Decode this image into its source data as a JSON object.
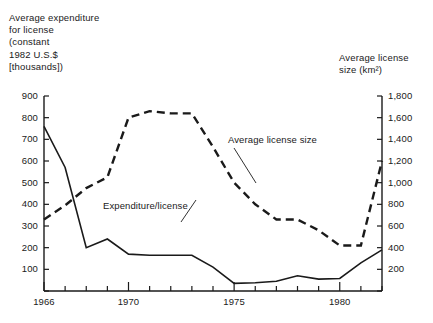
{
  "chart_data": {
    "type": "line",
    "title": "",
    "xlabel": "",
    "ylabel": "Average expenditure\nfor license\n(constant\n1982 U.S.$\n[thousands])",
    "y2label": "Average license\nsize (km²)",
    "grid": false,
    "legend_position": "inline-annotations",
    "xlim": [
      1966,
      1982
    ],
    "ylim": [
      0,
      900
    ],
    "y2lim": [
      0,
      1800
    ],
    "x_tick_values": [
      1966,
      1967,
      1968,
      1969,
      1970,
      1971,
      1972,
      1973,
      1974,
      1975,
      1976,
      1977,
      1978,
      1979,
      1980,
      1981,
      1982
    ],
    "x_tick_labels": [
      "1966",
      "",
      "",
      "",
      "1970",
      "",
      "",
      "",
      "",
      "1975",
      "",
      "",
      "",
      "",
      "1980",
      "",
      ""
    ],
    "x_major_ticks": [
      1966,
      1970,
      1975,
      1980
    ],
    "y_tick_values": [
      0,
      100,
      200,
      300,
      400,
      500,
      600,
      700,
      800,
      900
    ],
    "y_tick_labels": [
      "",
      "100",
      "200",
      "300",
      "400",
      "500",
      "600",
      "700",
      "800",
      "900"
    ],
    "y2_tick_values": [
      0,
      200,
      400,
      600,
      800,
      1000,
      1200,
      1400,
      1600,
      1800
    ],
    "y2_tick_labels": [
      "",
      "200",
      "400",
      "600",
      "800",
      "1,000",
      "1,200",
      "1,400",
      "1,600",
      "1,800"
    ],
    "x": [
      1966,
      1967,
      1968,
      1969,
      1970,
      1971,
      1972,
      1973,
      1974,
      1975,
      1976,
      1977,
      1978,
      1979,
      1980,
      1981,
      1982
    ],
    "series": [
      {
        "name": "Expenditure/license",
        "axis": "left",
        "style": "solid",
        "color": "#1a1a1a",
        "values": [
          760,
          570,
          200,
          240,
          170,
          165,
          165,
          165,
          110,
          35,
          38,
          45,
          70,
          55,
          58,
          130,
          190
        ]
      },
      {
        "name": "Average license size",
        "axis": "right",
        "style": "dashed",
        "color": "#1a1a1a",
        "values": [
          660,
          790,
          950,
          1050,
          1600,
          1660,
          1640,
          1640,
          1330,
          1000,
          800,
          660,
          660,
          560,
          420,
          420,
          1200
        ]
      }
    ],
    "annotations": [
      {
        "text": "Expenditure/license",
        "anchor_year": 1972.6,
        "anchor_value_left": 120
      },
      {
        "text": "Average license size",
        "anchor_year": 1975.2,
        "anchor_value_right": 760
      }
    ]
  },
  "axes": {
    "left_title": "Average expenditure\nfor license\n(constant\n1982 U.S.$\n[thousands])",
    "right_title": "Average license\nsize (km²)"
  },
  "labels": {
    "expenditure_per_license": "Expenditure/license",
    "average_license_size": "Average license size"
  },
  "colors": {
    "ink": "#1a1a1a",
    "background": "#ffffff"
  }
}
